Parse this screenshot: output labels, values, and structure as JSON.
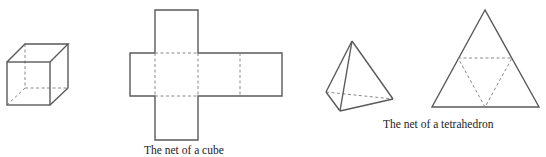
{
  "figures": {
    "cube": {
      "label": "cube",
      "caption": ""
    },
    "cube_net": {
      "label": "net of a cube",
      "caption": "The net of a cube"
    },
    "tetrahedron": {
      "label": "tetrahedron",
      "caption": ""
    },
    "tetrahedron_net": {
      "label": "net of a tetrahedron",
      "caption": "The net of a tetrahedron"
    }
  },
  "colors": {
    "edge": "#5a5a5a",
    "hidden_edge": "#8a8a8a",
    "text": "#222222",
    "background": "#ffffff"
  }
}
